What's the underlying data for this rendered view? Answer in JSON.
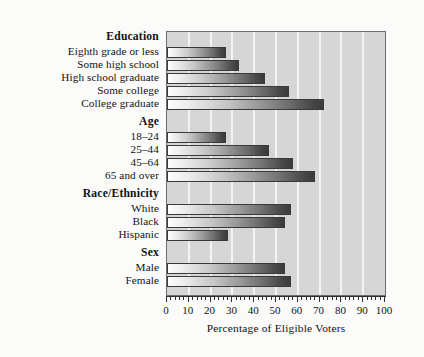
{
  "chart_data": {
    "type": "bar",
    "orientation": "horizontal",
    "title": "",
    "xlabel": "Percentage of Eligible Voters",
    "ylabel": "",
    "xlim": [
      0,
      100
    ],
    "xticks": [
      0,
      10,
      20,
      30,
      40,
      50,
      60,
      70,
      80,
      90,
      100
    ],
    "xtick_labels": [
      "0",
      "10",
      "20",
      "30",
      "40",
      "50",
      "60",
      "70",
      "80",
      "90",
      "100"
    ],
    "grid": true,
    "grid_axis": "x",
    "legend": null,
    "groups": [
      {
        "name": "Education",
        "categories": [
          "Eighth grade or less",
          "Some high school",
          "High school graduate",
          "Some college",
          "College graduate"
        ],
        "values": [
          27,
          33,
          45,
          56,
          72
        ]
      },
      {
        "name": "Age",
        "categories": [
          "18–24",
          "25–44",
          "45–64",
          "65 and over"
        ],
        "values": [
          27,
          47,
          58,
          68
        ]
      },
      {
        "name": "Race/Ethnicity",
        "categories": [
          "White",
          "Black",
          "Hispanic"
        ],
        "values": [
          57,
          54,
          28
        ]
      },
      {
        "name": "Sex",
        "categories": [
          "Male",
          "Female"
        ],
        "values": [
          54,
          57
        ]
      }
    ],
    "categories": [
      "Eighth grade or less",
      "Some high school",
      "High school graduate",
      "Some college",
      "College graduate",
      "18–24",
      "25–44",
      "45–64",
      "65 and over",
      "White",
      "Black",
      "Hispanic",
      "Male",
      "Female"
    ],
    "values": [
      27,
      33,
      45,
      56,
      72,
      27,
      47,
      58,
      68,
      57,
      54,
      28,
      54,
      57
    ]
  },
  "rows": [
    {
      "label": "Education",
      "type": "group",
      "top": 0
    },
    {
      "label": "Eighth grade or less",
      "type": "bar",
      "top": 14,
      "value": 27
    },
    {
      "label": "Some high school",
      "type": "bar",
      "top": 27,
      "value": 33
    },
    {
      "label": "High school graduate",
      "type": "bar",
      "top": 40,
      "value": 45
    },
    {
      "label": "Some college",
      "type": "bar",
      "top": 53,
      "value": 56
    },
    {
      "label": "College graduate",
      "type": "bar",
      "top": 66,
      "value": 72
    },
    {
      "label": "Age",
      "type": "group",
      "top": 85
    },
    {
      "label": "18–24",
      "type": "bar",
      "top": 99,
      "value": 27
    },
    {
      "label": "25–44",
      "type": "bar",
      "top": 112,
      "value": 47
    },
    {
      "label": "45–64",
      "type": "bar",
      "top": 125,
      "value": 58
    },
    {
      "label": "65 and over",
      "type": "bar",
      "top": 138,
      "value": 68
    },
    {
      "label": "Race/Ethnicity",
      "type": "group",
      "top": 157
    },
    {
      "label": "White",
      "type": "bar",
      "top": 171,
      "value": 57
    },
    {
      "label": "Black",
      "type": "bar",
      "top": 184,
      "value": 54
    },
    {
      "label": "Hispanic",
      "type": "bar",
      "top": 197,
      "value": 28
    },
    {
      "label": "Sex",
      "type": "group",
      "top": 216
    },
    {
      "label": "Male",
      "type": "bar",
      "top": 230,
      "value": 54
    },
    {
      "label": "Female",
      "type": "bar",
      "top": 243,
      "value": 57
    }
  ],
  "colors": {
    "page_background": "#fbfbfa",
    "plot_background": "#d6d6d6",
    "gridline": "#f4f4f4",
    "bar_light": "#fdfdfd",
    "bar_dark": "#3b3b3b",
    "bar_outline": "#3a3a3a",
    "frame": "#6e6e6e",
    "text": "#121212"
  }
}
